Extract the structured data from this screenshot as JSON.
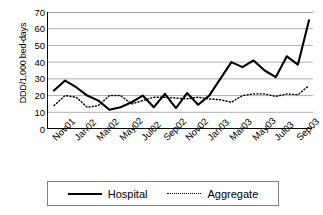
{
  "chart_data": {
    "type": "line",
    "title": "",
    "xlabel": "",
    "ylabel": "DDD/1,000 bed-days",
    "ylim": [
      0,
      70
    ],
    "ytick_values": [
      70,
      60,
      50,
      40,
      30,
      20,
      10,
      0
    ],
    "grid": true,
    "legend_position": "bottom",
    "x": [
      "Nov01",
      "Dec01",
      "Jan02",
      "Feb02",
      "Mar02",
      "Apr02",
      "May02",
      "Jun02",
      "Jul02",
      "Aug02",
      "Sep02",
      "Oct02",
      "Nov02",
      "Dec02",
      "Jan03",
      "Feb03",
      "Mar03",
      "Apr03",
      "May03",
      "Jun03",
      "Jul03",
      "Aug03",
      "Sep03",
      "Oct03"
    ],
    "xtick_labels": [
      "Nov01",
      "Jan02",
      "Mar02",
      "May02",
      "Jul02",
      "Sep02",
      "Nov02",
      "Jan03",
      "Mar03",
      "May03",
      "Jul03",
      "Sep03"
    ],
    "xtick_indices": [
      0,
      2,
      4,
      6,
      8,
      10,
      12,
      14,
      16,
      18,
      20,
      22
    ],
    "series": [
      {
        "name": "Hospital",
        "style": "solid",
        "color": "#000000",
        "values": [
          23,
          29,
          25,
          20,
          17,
          11.5,
          13,
          16,
          20,
          13,
          21,
          12.5,
          21.5,
          14.5,
          20,
          30,
          40,
          37,
          41,
          35,
          31,
          43.5,
          38.5,
          65
        ]
      },
      {
        "name": "Aggregate",
        "style": "dotted",
        "color": "#000000",
        "values": [
          14,
          20,
          19,
          13,
          14,
          20,
          20,
          15,
          17,
          19,
          19,
          18.5,
          18,
          19,
          18,
          17.5,
          16,
          20,
          21,
          21,
          19.5,
          21,
          20.5,
          26
        ]
      }
    ]
  },
  "legend": {
    "items": [
      {
        "label": "Hospital",
        "style": "solid"
      },
      {
        "label": "Aggregate",
        "style": "dotted"
      }
    ]
  }
}
